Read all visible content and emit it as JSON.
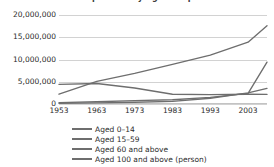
{
  "chart_data": {
    "type": "line",
    "title": "Population by Age Group",
    "xlabel": "",
    "ylabel": "",
    "x": [
      1953,
      1963,
      1973,
      1983,
      1993,
      2003,
      2008
    ],
    "tick_labels": [
      "1953",
      "1963",
      "1973",
      "1983",
      "1993",
      "2003"
    ],
    "xlim": [
      1953,
      2008
    ],
    "ylim": [
      0,
      20000000
    ],
    "yticks": [
      0,
      5000000,
      10000000,
      15000000,
      20000000
    ],
    "ytick_labels": [
      "0",
      "5,000,000",
      "10,000,000",
      "15,000,000",
      "20,000,000"
    ],
    "grid": true,
    "legend_position": "bottom",
    "line_color": "#6e6e6e",
    "gridline_color": "#d2d2d2",
    "series": [
      {
        "name": "Aged 0–14",
        "values": [
          4400000,
          4600000,
          3600000,
          2200000,
          2100000,
          2200000,
          2150000
        ]
      },
      {
        "name": "Aged 15–59",
        "values": [
          2200000,
          5100000,
          6900000,
          8900000,
          11000000,
          13900000,
          17600000
        ]
      },
      {
        "name": "Aged 60 and above",
        "values": [
          300000,
          500000,
          750000,
          950000,
          1500000,
          2400000,
          9400000
        ]
      },
      {
        "name": "Aged 100 and above (person)",
        "values": [
          150000,
          250000,
          400000,
          600000,
          1300000,
          2500000,
          3500000
        ]
      }
    ]
  },
  "legend": {
    "items": [
      "Aged 0–14",
      "Aged 15–59",
      "Aged 60 and above",
      "Aged 100 and above (person)"
    ]
  }
}
